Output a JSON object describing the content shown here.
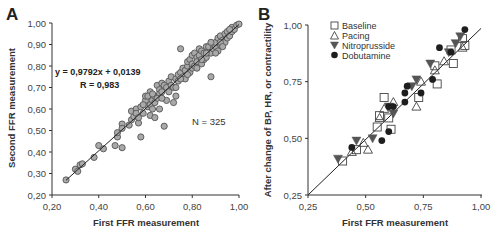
{
  "chart_data": [
    {
      "panel": "A",
      "type": "scatter",
      "title": "",
      "xlabel": "First FFR measurement",
      "ylabel": "Second FFR measurement",
      "xlim": [
        0.2,
        1.0
      ],
      "ylim": [
        0.2,
        1.0
      ],
      "xticks": [
        "0,20",
        "0,40",
        "0,60",
        "0,80",
        "1,00"
      ],
      "yticks": [
        "0,20",
        "0,30",
        "0,40",
        "0,50",
        "0,60",
        "0,70",
        "0,80",
        "0,90",
        "1,00"
      ],
      "grid": false,
      "annotations": {
        "equation": "y = 0,9792x + 0,0139",
        "r": "R = 0,983",
        "n": "N = 325"
      },
      "regression": {
        "slope": 0.9792,
        "intercept": 0.0139,
        "x_range": [
          0.26,
          1.0
        ]
      },
      "marker": {
        "shape": "circle",
        "fill": "#a9a9a9",
        "stroke": "#555555"
      },
      "series": [
        {
          "name": "FFR pairs",
          "points": [
            [
              0.26,
              0.27
            ],
            [
              0.3,
              0.32
            ],
            [
              0.31,
              0.31
            ],
            [
              0.32,
              0.34
            ],
            [
              0.33,
              0.345
            ],
            [
              0.38,
              0.375
            ],
            [
              0.4,
              0.43
            ],
            [
              0.42,
              0.415
            ],
            [
              0.47,
              0.43
            ],
            [
              0.48,
              0.47
            ],
            [
              0.48,
              0.49
            ],
            [
              0.5,
              0.42
            ],
            [
              0.5,
              0.53
            ],
            [
              0.5,
              0.51
            ],
            [
              0.53,
              0.525
            ],
            [
              0.54,
              0.55
            ],
            [
              0.55,
              0.565
            ],
            [
              0.54,
              0.59
            ],
            [
              0.56,
              0.6
            ],
            [
              0.57,
              0.535
            ],
            [
              0.58,
              0.47
            ],
            [
              0.56,
              0.58
            ],
            [
              0.58,
              0.61
            ],
            [
              0.59,
              0.58
            ],
            [
              0.6,
              0.64
            ],
            [
              0.6,
              0.66
            ],
            [
              0.61,
              0.61
            ],
            [
              0.62,
              0.62
            ],
            [
              0.62,
              0.68
            ],
            [
              0.63,
              0.64
            ],
            [
              0.63,
              0.6
            ],
            [
              0.64,
              0.66
            ],
            [
              0.64,
              0.63
            ],
            [
              0.65,
              0.71
            ],
            [
              0.66,
              0.69
            ],
            [
              0.66,
              0.67
            ],
            [
              0.67,
              0.72
            ],
            [
              0.67,
              0.68
            ],
            [
              0.68,
              0.52
            ],
            [
              0.68,
              0.71
            ],
            [
              0.69,
              0.7
            ],
            [
              0.7,
              0.73
            ],
            [
              0.7,
              0.68
            ],
            [
              0.71,
              0.71
            ],
            [
              0.71,
              0.75
            ],
            [
              0.72,
              0.63
            ],
            [
              0.72,
              0.7
            ],
            [
              0.73,
              0.74
            ],
            [
              0.73,
              0.66
            ],
            [
              0.74,
              0.76
            ],
            [
              0.74,
              0.73
            ],
            [
              0.75,
              0.88
            ],
            [
              0.75,
              0.77
            ],
            [
              0.76,
              0.75
            ],
            [
              0.76,
              0.79
            ],
            [
              0.77,
              0.78
            ],
            [
              0.77,
              0.74
            ],
            [
              0.78,
              0.8
            ],
            [
              0.78,
              0.82
            ],
            [
              0.79,
              0.77
            ],
            [
              0.79,
              0.83
            ],
            [
              0.8,
              0.79
            ],
            [
              0.8,
              0.81
            ],
            [
              0.8,
              0.85
            ],
            [
              0.81,
              0.8
            ],
            [
              0.81,
              0.86
            ],
            [
              0.82,
              0.84
            ],
            [
              0.82,
              0.82
            ],
            [
              0.83,
              0.88
            ],
            [
              0.83,
              0.85
            ],
            [
              0.84,
              0.81
            ],
            [
              0.84,
              0.87
            ],
            [
              0.85,
              0.83
            ],
            [
              0.85,
              0.86
            ],
            [
              0.86,
              0.89
            ],
            [
              0.86,
              0.84
            ],
            [
              0.87,
              0.87
            ],
            [
              0.87,
              0.89
            ],
            [
              0.88,
              0.75
            ],
            [
              0.88,
              0.86
            ],
            [
              0.89,
              0.88
            ],
            [
              0.89,
              0.9
            ],
            [
              0.9,
              0.89
            ],
            [
              0.9,
              0.91
            ],
            [
              0.91,
              0.87
            ],
            [
              0.91,
              0.93
            ],
            [
              0.92,
              0.94
            ],
            [
              0.92,
              0.9
            ],
            [
              0.93,
              0.92
            ],
            [
              0.94,
              0.95
            ],
            [
              0.94,
              0.91
            ],
            [
              0.95,
              0.93
            ],
            [
              0.95,
              0.96
            ],
            [
              0.96,
              0.94
            ],
            [
              0.97,
              0.96
            ],
            [
              0.97,
              0.98
            ],
            [
              0.98,
              0.97
            ],
            [
              0.99,
              0.99
            ],
            [
              1.0,
              0.995
            ],
            [
              0.62,
              0.57
            ],
            [
              0.64,
              0.56
            ],
            [
              0.66,
              0.6
            ],
            [
              0.69,
              0.64
            ],
            [
              0.61,
              0.66
            ],
            [
              0.57,
              0.56
            ],
            [
              0.59,
              0.62
            ],
            [
              0.63,
              0.67
            ],
            [
              0.65,
              0.65
            ],
            [
              0.67,
              0.65
            ],
            [
              0.73,
              0.7
            ],
            [
              0.75,
              0.74
            ],
            [
              0.78,
              0.76
            ],
            [
              0.82,
              0.79
            ],
            [
              0.84,
              0.83
            ],
            [
              0.86,
              0.86
            ],
            [
              0.88,
              0.91
            ],
            [
              0.9,
              0.86
            ],
            [
              0.92,
              0.91
            ],
            [
              0.93,
              0.89
            ],
            [
              0.96,
              0.97
            ]
          ]
        }
      ]
    },
    {
      "panel": "B",
      "type": "scatter",
      "title": "",
      "xlabel": "First FFR measurement",
      "ylabel": "After change of BP, HR, or contractility",
      "xlim": [
        0.25,
        1.0
      ],
      "ylim": [
        0.25,
        1.0
      ],
      "xticks": [
        "0,25",
        "0,50",
        "0,75",
        "1,00"
      ],
      "yticks": [
        "0,25",
        "0,50",
        "0,75",
        "1,00"
      ],
      "grid": false,
      "legend_position": "upper-left",
      "identity_line": {
        "from": [
          0.25,
          0.25
        ],
        "to": [
          1.0,
          0.985
        ]
      },
      "series": [
        {
          "name": "Baseline",
          "marker": "open-square",
          "points": [
            [
              0.4,
              0.4
            ],
            [
              0.46,
              0.45
            ],
            [
              0.55,
              0.55
            ],
            [
              0.56,
              0.6
            ],
            [
              0.58,
              0.68
            ],
            [
              0.6,
              0.59
            ],
            [
              0.61,
              0.54
            ],
            [
              0.73,
              0.68
            ],
            [
              0.8,
              0.82
            ],
            [
              0.81,
              0.74
            ],
            [
              0.87,
              0.89
            ],
            [
              0.88,
              0.83
            ],
            [
              0.93,
              0.91
            ],
            [
              0.92,
              0.94
            ]
          ]
        },
        {
          "name": "Pacing",
          "marker": "open-triangle-up",
          "points": [
            [
              0.44,
              0.44
            ],
            [
              0.49,
              0.48
            ],
            [
              0.51,
              0.45
            ],
            [
              0.56,
              0.59
            ],
            [
              0.62,
              0.66
            ],
            [
              0.72,
              0.64
            ],
            [
              0.74,
              0.75
            ],
            [
              0.8,
              0.8
            ],
            [
              0.84,
              0.84
            ],
            [
              0.92,
              0.9
            ],
            [
              0.58,
              0.63
            ]
          ]
        },
        {
          "name": "Nitroprusside",
          "marker": "filled-triangle-down",
          "points": [
            [
              0.38,
              0.41
            ],
            [
              0.46,
              0.49
            ],
            [
              0.53,
              0.5
            ],
            [
              0.6,
              0.64
            ],
            [
              0.62,
              0.61
            ],
            [
              0.7,
              0.73
            ],
            [
              0.72,
              0.76
            ],
            [
              0.78,
              0.83
            ],
            [
              0.86,
              0.88
            ],
            [
              0.89,
              0.92
            ],
            [
              0.91,
              0.95
            ]
          ]
        },
        {
          "name": "Dobutamine",
          "marker": "filled-circle",
          "points": [
            [
              0.44,
              0.46
            ],
            [
              0.57,
              0.49
            ],
            [
              0.6,
              0.53
            ],
            [
              0.6,
              0.64
            ],
            [
              0.62,
              0.64
            ],
            [
              0.67,
              0.66
            ],
            [
              0.67,
              0.7
            ],
            [
              0.68,
              0.73
            ],
            [
              0.74,
              0.7
            ],
            [
              0.79,
              0.76
            ],
            [
              0.82,
              0.9
            ],
            [
              0.87,
              0.88
            ],
            [
              0.93,
              0.98
            ]
          ]
        }
      ]
    }
  ],
  "panels": {
    "a": {
      "letter": "A",
      "xlabel": "First FFR measurement",
      "ylabel": "Second FFR measurement",
      "equation": "y = 0,9792x + 0,0139",
      "r": "R = 0,983",
      "n": "N = 325"
    },
    "b": {
      "letter": "B",
      "xlabel": "First FFR measurement",
      "ylabel": "After change of BP, HR, or contractility",
      "legend": [
        "Baseline",
        "Pacing",
        "Nitroprusside",
        "Dobutamine"
      ]
    }
  },
  "colors": {
    "axis": "#333333",
    "marker_gray_fill": "#a9a9a9",
    "marker_gray_stroke": "#555555",
    "marker_dark": "#1e1e1e",
    "triangle_dark": "#555555",
    "line": "#222222"
  }
}
